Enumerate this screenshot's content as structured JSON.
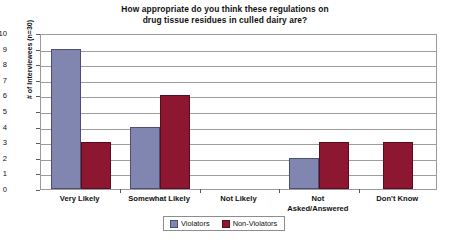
{
  "chart_data": {
    "type": "bar",
    "title": "How appropriate do you think these regulations on drug tissue residues in culled dairy are?",
    "title_lines": [
      "How appropriate do you think these regulations on",
      "drug tissue residues in culled dairy are?"
    ],
    "xlabel": "",
    "ylabel": "# of Interviewees (n=30)",
    "ylim": [
      0,
      10
    ],
    "ytick_labels": [
      "10",
      "9",
      "8",
      "7",
      "6",
      "5",
      "4",
      "3",
      "2",
      "1",
      "0"
    ],
    "grid": true,
    "legend_position": "bottom",
    "categories": [
      "Very Likely",
      "Somewhat Likely",
      "Not Likely",
      "Not Asked/Answered",
      "Don't Know"
    ],
    "category_label_lines": [
      [
        "Very Likely"
      ],
      [
        "Somewhat Likely"
      ],
      [
        "Not Likely"
      ],
      [
        "Not",
        "Asked/Answered"
      ],
      [
        "Don't Know"
      ]
    ],
    "series": [
      {
        "name": "Violators",
        "color": "#8186b0",
        "values": [
          9,
          4,
          0,
          2,
          0
        ]
      },
      {
        "name": "Non-Violators",
        "color": "#8d1630",
        "values": [
          3,
          6,
          0,
          3,
          3
        ]
      }
    ]
  }
}
